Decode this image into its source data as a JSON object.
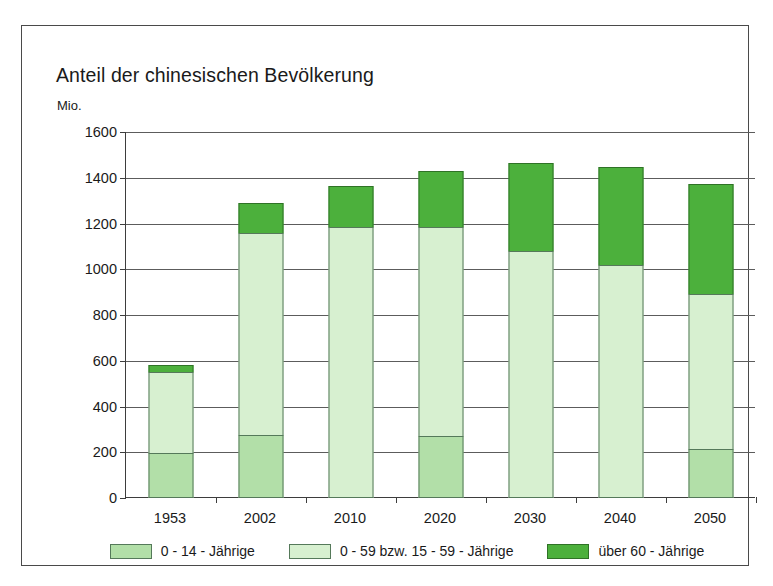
{
  "chart_data": {
    "type": "bar",
    "stacked": true,
    "title": "Anteil der chinesischen Bevölkerung",
    "subtitle": "Mio.",
    "ylabel": "Mio.",
    "xlabel": "",
    "ylim": [
      0,
      1600
    ],
    "ytick_step": 200,
    "yticks": [
      0,
      200,
      400,
      600,
      800,
      1000,
      1200,
      1400,
      1600
    ],
    "grid": "horizontal",
    "legend_position": "bottom",
    "categories": [
      "1953",
      "2002",
      "2010",
      "2020",
      "2030",
      "2040",
      "2050"
    ],
    "series": [
      {
        "name": "0 - 14 - Jährige",
        "color": "#b2dfa8",
        "values": [
          195,
          275,
          0,
          273,
          0,
          0,
          215
        ]
      },
      {
        "name": "0 - 59 bzw. 15 - 59 - Jährige",
        "color": "#d7f0d0",
        "values": [
          360,
          890,
          1185,
          917,
          1080,
          1020,
          680
        ]
      },
      {
        "name": "über 60 - Jährige",
        "color": "#4cb03c",
        "values": [
          35,
          135,
          185,
          250,
          390,
          430,
          485
        ]
      }
    ],
    "totals": [
      590,
      1300,
      1370,
      1440,
      1470,
      1450,
      1380
    ],
    "segment_tops": {
      "1953": [
        195,
        555,
        590
      ],
      "2002": [
        275,
        1165,
        1300
      ],
      "2010": [
        0,
        1185,
        1370
      ],
      "2020": [
        273,
        1190,
        1440
      ],
      "2030": [
        0,
        1080,
        1470
      ],
      "2040": [
        0,
        1020,
        1450
      ],
      "2050": [
        215,
        895,
        1380
      ]
    }
  },
  "legend": {
    "items": [
      {
        "label": "0 - 14 - Jährige",
        "swatch": "c0"
      },
      {
        "label": "0 - 59 bzw. 15 - 59 - Jährige",
        "swatch": "c1"
      },
      {
        "label": "über 60 - Jährige",
        "swatch": "c2"
      }
    ]
  },
  "colors": {
    "series_0_14": "#b2dfa8",
    "series_15_59": "#d7f0d0",
    "series_60_plus": "#4cb03c",
    "axis": "#3d3d3d",
    "grid": "#5c5c5c",
    "frame": "#4a4a4a",
    "background": "#ffffff",
    "text": "#1a1a1a"
  }
}
